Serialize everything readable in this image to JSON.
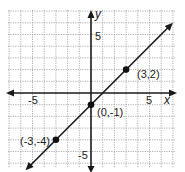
{
  "chart_data": {
    "type": "line",
    "title": "",
    "xlabel": "x",
    "ylabel": "y",
    "xlim": [
      -7,
      7
    ],
    "ylim": [
      -6,
      7
    ],
    "grid": true,
    "x_ticks_labeled": [
      -5,
      5
    ],
    "y_ticks_labeled": [
      5,
      -5
    ],
    "line": {
      "slope": 1,
      "intercept": -1,
      "equation": "y = x - 1"
    },
    "points": [
      {
        "x": 3,
        "y": 2,
        "label": "(3,2)"
      },
      {
        "x": 0,
        "y": -1,
        "label": "(0,-1)"
      },
      {
        "x": -3,
        "y": -4,
        "label": "(-3,-4)"
      }
    ]
  },
  "labels": {
    "x_axis": "x",
    "y_axis": "y",
    "x_neg5": "-5",
    "x_pos5": "5",
    "y_pos5": "5",
    "y_neg5": "-5",
    "p1": "(3,2)",
    "p2": "(0,-1)",
    "p3": "(-3,-4)"
  },
  "colors": {
    "grid": "#9a9a9a",
    "axis": "#1a1a1a",
    "line": "#1a1a1a",
    "point": "#111111"
  }
}
